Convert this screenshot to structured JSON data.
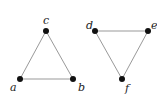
{
  "graphs": [
    {
      "name": "left-triangle",
      "nodes": [
        {
          "id": "a",
          "label": "a",
          "x": 20,
          "y": 79,
          "lx": 10,
          "ly": 91
        },
        {
          "id": "b",
          "label": "b",
          "x": 73,
          "y": 79,
          "lx": 78,
          "ly": 91
        },
        {
          "id": "c",
          "label": "c",
          "x": 46,
          "y": 31,
          "lx": 43,
          "ly": 24
        }
      ],
      "edges": [
        [
          "a",
          "b"
        ],
        [
          "b",
          "c"
        ],
        [
          "c",
          "a"
        ]
      ]
    },
    {
      "name": "right-triangle",
      "nodes": [
        {
          "id": "d",
          "label": "d",
          "x": 95,
          "y": 31,
          "lx": 86,
          "ly": 29
        },
        {
          "id": "e",
          "label": "e",
          "x": 148,
          "y": 31,
          "lx": 151,
          "ly": 29
        },
        {
          "id": "f",
          "label": "f",
          "x": 122,
          "y": 79,
          "lx": 125,
          "ly": 92
        }
      ],
      "edges": [
        [
          "d",
          "e"
        ],
        [
          "e",
          "f"
        ],
        [
          "f",
          "d"
        ]
      ]
    }
  ],
  "colors": {
    "edge": "#999999",
    "node": "#111111"
  }
}
